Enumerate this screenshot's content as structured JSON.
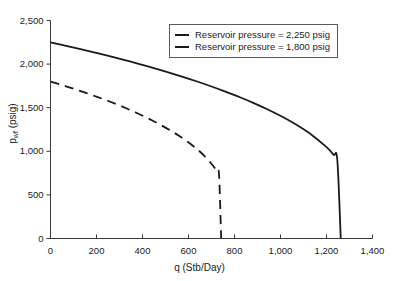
{
  "chart_data": {
    "type": "line",
    "title": "",
    "xlabel": "q (Stb/Day)",
    "ylabel": "p_wf (psig)",
    "ylabel_base": "p",
    "ylabel_sub": "wf",
    "ylabel_unit": " (psig)",
    "xlim": [
      0,
      1400
    ],
    "ylim": [
      0,
      2500
    ],
    "grid": false,
    "legend_position": "top-right-inside",
    "xticks": [
      0,
      200,
      400,
      600,
      800,
      1000,
      1200,
      1400
    ],
    "xtick_labels": [
      "0",
      "200",
      "400",
      "600",
      "800",
      "1,000",
      "1,200",
      "1,400"
    ],
    "yticks": [
      0,
      500,
      1000,
      1500,
      2000,
      2500
    ],
    "ytick_labels": [
      "0",
      "500",
      "1,000",
      "1,500",
      "2,000",
      "2,500"
    ],
    "series": [
      {
        "name": "Reservoir pressure = 2,250 psig",
        "style": "solid",
        "color": "#1a1a1a",
        "reservoir_pressure": 2250,
        "max_flow_rate": 1262,
        "x": [
          0,
          63,
          126,
          189,
          252,
          315,
          379,
          442,
          505,
          568,
          631,
          694,
          757,
          821,
          884,
          947,
          1010,
          1073,
          1136,
          1199,
          1231,
          1247,
          1262
        ],
        "y": [
          2250,
          2213,
          2175,
          2135,
          2094,
          2051,
          2006,
          1960,
          1911,
          1860,
          1806,
          1749,
          1688,
          1623,
          1553,
          1477,
          1393,
          1298,
          1188,
          1050,
          960,
          900,
          0
        ]
      },
      {
        "name": "Reservoir pressure = 1,800 psig",
        "style": "dashed",
        "color": "#1a1a1a",
        "reservoir_pressure": 1800,
        "max_flow_rate": 742,
        "x": [
          0,
          37,
          74,
          111,
          148,
          185,
          223,
          260,
          297,
          334,
          371,
          408,
          445,
          482,
          519,
          557,
          594,
          631,
          668,
          705,
          724,
          733,
          742
        ],
        "y": [
          1800,
          1770,
          1740,
          1708,
          1675,
          1641,
          1605,
          1568,
          1529,
          1488,
          1445,
          1399,
          1350,
          1298,
          1242,
          1181,
          1114,
          1038,
          950,
          840,
          768,
          720,
          0
        ]
      }
    ]
  },
  "legend": {
    "items": [
      {
        "label": "Reservoir pressure = 2,250 psig",
        "style": "solid"
      },
      {
        "label": "Reservoir pressure = 1,800 psig",
        "style": "solid"
      }
    ]
  },
  "axes": {
    "x_title": "q (Stb/Day)",
    "y_title_base": "p",
    "y_title_sub": "wf",
    "y_title_unit": " (psig)"
  },
  "colors": {
    "axis": "#3a3a3a",
    "curve": "#1a1a1a",
    "legend_border": "#5a5a5a",
    "background": "#ffffff"
  }
}
